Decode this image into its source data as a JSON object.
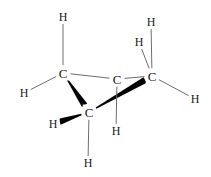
{
  "figure": {
    "width": 211,
    "height": 177,
    "background_color": "#ffffff",
    "thin_bond_color": "#6e6e6e",
    "bold_bond_color": "#000000",
    "label_color": "#1a1a1a"
  },
  "atoms": [
    {
      "id": "c-left",
      "element": "C",
      "x": 63,
      "y": 73,
      "kind": "carbon"
    },
    {
      "id": "c-middle",
      "element": "C",
      "x": 117,
      "y": 79,
      "kind": "carbon"
    },
    {
      "id": "c-right",
      "element": "C",
      "x": 152,
      "y": 76,
      "kind": "carbon"
    },
    {
      "id": "c-bottom",
      "element": "C",
      "x": 89,
      "y": 112,
      "kind": "carbon"
    },
    {
      "id": "h-top-left",
      "element": "H",
      "x": 63,
      "y": 17,
      "kind": "hydrogen"
    },
    {
      "id": "h-left",
      "element": "H",
      "x": 24,
      "y": 93,
      "kind": "hydrogen"
    },
    {
      "id": "h-top-right",
      "element": "H",
      "x": 151,
      "y": 22,
      "kind": "hydrogen"
    },
    {
      "id": "h-inner",
      "element": "H",
      "x": 139,
      "y": 42,
      "kind": "hydrogen"
    },
    {
      "id": "h-right",
      "element": "H",
      "x": 195,
      "y": 99,
      "kind": "hydrogen"
    },
    {
      "id": "h-lower-left",
      "element": "H",
      "x": 53,
      "y": 124,
      "kind": "hydrogen"
    },
    {
      "id": "h-lower-mid",
      "element": "H",
      "x": 116,
      "y": 131,
      "kind": "hydrogen"
    },
    {
      "id": "h-bottom",
      "element": "H",
      "x": 88,
      "y": 163,
      "kind": "hydrogen"
    }
  ],
  "bonds": [
    {
      "id": "bond-cleft-cmiddle",
      "from": "c-left",
      "to": "c-middle",
      "style": "plain"
    },
    {
      "id": "bond-cmiddle-cright",
      "from": "c-middle",
      "to": "c-right",
      "style": "plain"
    },
    {
      "id": "bond-cleft-cbottom",
      "from": "c-left",
      "to": "c-bottom",
      "style": "wedge"
    },
    {
      "id": "bond-cbottom-cright",
      "from": "c-bottom",
      "to": "c-right",
      "style": "wedge"
    },
    {
      "id": "bond-cleft-htop",
      "from": "c-left",
      "to": "h-top-left",
      "style": "plain"
    },
    {
      "id": "bond-cleft-hleft",
      "from": "c-left",
      "to": "h-left",
      "style": "plain"
    },
    {
      "id": "bond-cright-htop",
      "from": "c-right",
      "to": "h-top-right",
      "style": "plain"
    },
    {
      "id": "bond-cright-hinner",
      "from": "c-right",
      "to": "h-inner",
      "style": "plain"
    },
    {
      "id": "bond-cright-hright",
      "from": "c-right",
      "to": "h-right",
      "style": "plain"
    },
    {
      "id": "bond-cbottom-hlower",
      "from": "c-bottom",
      "to": "h-lower-left",
      "style": "wedge"
    },
    {
      "id": "bond-cmiddle-hlowermid",
      "from": "c-middle",
      "to": "h-lower-mid",
      "style": "plain"
    },
    {
      "id": "bond-cbottom-hbottom",
      "from": "c-bottom",
      "to": "h-bottom",
      "style": "plain"
    }
  ]
}
